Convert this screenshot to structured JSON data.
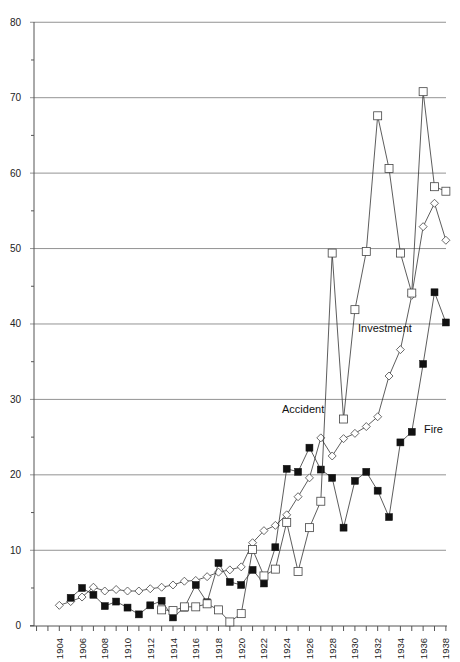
{
  "chart_data": {
    "type": "line",
    "title": "",
    "xlabel": "",
    "ylabel": "",
    "ylim": [
      0,
      80
    ],
    "yticks": [
      0,
      10,
      20,
      30,
      40,
      50,
      60,
      70,
      80
    ],
    "grid": true,
    "legend": "inline labels",
    "x": [
      1904,
      1905,
      1906,
      1907,
      1908,
      1909,
      1910,
      1911,
      1912,
      1913,
      1914,
      1915,
      1916,
      1917,
      1918,
      1919,
      1920,
      1921,
      1922,
      1923,
      1924,
      1925,
      1926,
      1927,
      1928,
      1929,
      1930,
      1931,
      1932,
      1933,
      1934,
      1935,
      1936,
      1937,
      1938
    ],
    "xtick_labels": [
      "1904",
      "1906",
      "1908",
      "1910",
      "1912",
      "1914",
      "1916",
      "1918",
      "1920",
      "1922",
      "1924",
      "1926",
      "1928",
      "1930",
      "1932",
      "1934",
      "1936",
      "1938"
    ],
    "series": [
      {
        "name": "Accident",
        "marker": "open-diamond",
        "label_pos": {
          "x": 282,
          "y": 413
        },
        "values": [
          2.7,
          3.2,
          3.8,
          5.1,
          4.6,
          4.8,
          4.6,
          4.6,
          4.9,
          5.1,
          5.4,
          5.9,
          6.0,
          6.5,
          7.1,
          7.4,
          7.8,
          11.0,
          12.6,
          13.3,
          14.7,
          17.1,
          19.6,
          24.9,
          22.5,
          24.8,
          25.5,
          26.4,
          27.7,
          33.1,
          36.6,
          43.8,
          52.9,
          56.0,
          51.1
        ]
      },
      {
        "name": "Fire",
        "marker": "filled-square",
        "label_pos": {
          "x": 424,
          "y": 433
        },
        "values": [
          null,
          3.7,
          5.0,
          4.1,
          2.6,
          3.2,
          2.4,
          1.5,
          2.7,
          3.3,
          1.1,
          2.4,
          5.4,
          3.1,
          8.3,
          5.8,
          5.4,
          7.4,
          5.6,
          10.4,
          20.8,
          20.4,
          23.6,
          20.7,
          19.6,
          13.0,
          19.2,
          20.4,
          17.9,
          14.4,
          24.3,
          25.7,
          34.7,
          44.2,
          40.2
        ]
      },
      {
        "name": "Investment",
        "marker": "open-square",
        "label_pos": {
          "x": 358,
          "y": 332
        },
        "values": [
          null,
          null,
          null,
          null,
          null,
          null,
          null,
          null,
          null,
          2.1,
          2.0,
          2.5,
          2.5,
          2.9,
          2.1,
          0.5,
          1.6,
          10.1,
          6.6,
          7.5,
          13.7,
          7.2,
          13.0,
          16.5,
          49.4,
          27.4,
          41.9,
          49.6,
          67.6,
          60.6,
          49.4,
          44.1,
          70.8,
          58.2,
          57.6
        ]
      }
    ]
  }
}
